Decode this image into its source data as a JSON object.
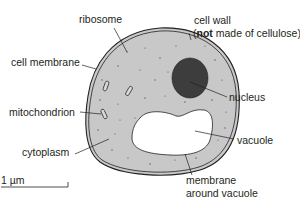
{
  "diagram": {
    "labels": {
      "ribosome": "ribosome",
      "cell_wall_line1": "cell wall",
      "cell_wall_open": "(",
      "cell_wall_not": "not",
      "cell_wall_rest": " made of cellulose)",
      "cell_membrane": "cell membrane",
      "nucleus": "nucleus",
      "mitochondrion": "mitochondrion",
      "vacuole": "vacuole",
      "cytoplasm": "cytoplasm",
      "membrane_line1": "membrane",
      "membrane_line2": "around vacuole"
    },
    "scale_bar": {
      "label": "1 µm"
    },
    "colors": {
      "cytoplasm": "#c8c8c8",
      "outline": "#231f20",
      "nucleus": "#3d3d3d",
      "vacuole": "#ffffff",
      "text": "#231f20"
    }
  }
}
